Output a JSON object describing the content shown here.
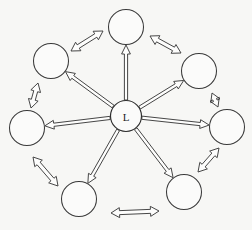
{
  "diagram": {
    "background_color": "#f7f7f5",
    "stroke_color": "#3a3a3a",
    "fill_color": "#fbfbfa",
    "hub": {
      "label": "L",
      "cx": 126,
      "cy": 116,
      "r": 15.5,
      "name": "leader-node"
    },
    "nodes": [
      {
        "id": "node-top",
        "label": "",
        "cx": 126,
        "cy": 27,
        "r": 17.5,
        "angle": -90
      },
      {
        "id": "node-upper-right",
        "label": "",
        "cx": 199,
        "cy": 71,
        "r": 17.5,
        "angle": -31
      },
      {
        "id": "node-right",
        "label": "",
        "cx": 227,
        "cy": 127,
        "r": 17.5,
        "angle": 9
      },
      {
        "id": "node-lower-right",
        "label": "",
        "cx": 184,
        "cy": 192,
        "r": 17.5,
        "angle": 58
      },
      {
        "id": "node-lower-left",
        "label": "",
        "cx": 79,
        "cy": 199,
        "r": 17.5,
        "angle": 121
      },
      {
        "id": "node-left",
        "label": "",
        "cx": 27,
        "cy": 128,
        "r": 17.5,
        "angle": 175
      },
      {
        "id": "node-upper-left",
        "label": "",
        "cx": 51,
        "cy": 61,
        "r": 17.5,
        "angle": -139
      }
    ],
    "spokes": [
      {
        "id": "spoke-to-top",
        "from": "leader-node",
        "to": "node-top",
        "direction": "outward",
        "style": "open-arrow"
      },
      {
        "id": "spoke-to-upper-right",
        "from": "leader-node",
        "to": "node-upper-right",
        "direction": "outward",
        "style": "open-arrow"
      },
      {
        "id": "spoke-to-right",
        "from": "leader-node",
        "to": "node-right",
        "direction": "outward",
        "style": "open-arrow"
      },
      {
        "id": "spoke-to-lower-right",
        "from": "leader-node",
        "to": "node-lower-right",
        "direction": "outward",
        "style": "open-arrow"
      },
      {
        "id": "spoke-to-lower-left",
        "from": "leader-node",
        "to": "node-lower-left",
        "direction": "outward",
        "style": "open-arrow"
      },
      {
        "id": "spoke-to-left",
        "from": "leader-node",
        "to": "node-left",
        "direction": "outward",
        "style": "open-arrow"
      },
      {
        "id": "spoke-to-upper-left",
        "from": "leader-node",
        "to": "node-upper-left",
        "direction": "outward",
        "style": "open-arrow"
      }
    ],
    "rim_links": [
      {
        "id": "rim-upper-left-top",
        "from": "node-upper-left",
        "to": "node-top",
        "direction": "bidirectional",
        "x1": 71,
        "y1": 51,
        "x2": 103,
        "y2": 31
      },
      {
        "id": "rim-top-upper-right",
        "from": "node-top",
        "to": "node-upper-right",
        "direction": "bidirectional",
        "x1": 150,
        "y1": 36,
        "x2": 181,
        "y2": 53
      },
      {
        "id": "rim-upper-right-right",
        "from": "node-upper-right",
        "to": "node-right",
        "direction": "bidirectional",
        "x1": 212,
        "y1": 93,
        "x2": 218,
        "y2": 107
      },
      {
        "id": "rim-right-lower-right",
        "from": "node-right",
        "to": "node-lower-right",
        "direction": "bidirectional",
        "x1": 219,
        "y1": 148,
        "x2": 198,
        "y2": 172
      },
      {
        "id": "rim-lower-right-lower-left",
        "from": "node-lower-right",
        "to": "node-lower-left",
        "direction": "bidirectional",
        "x1": 159,
        "y1": 211,
        "x2": 111,
        "y2": 213
      },
      {
        "id": "rim-lower-left-left",
        "from": "node-lower-left",
        "to": "node-left",
        "direction": "bidirectional",
        "x1": 58,
        "y1": 186,
        "x2": 33,
        "y2": 157
      },
      {
        "id": "rim-left-upper-left",
        "from": "node-left",
        "to": "node-upper-left",
        "direction": "bidirectional",
        "x1": 31,
        "y1": 108,
        "x2": 38,
        "y2": 83
      }
    ]
  }
}
